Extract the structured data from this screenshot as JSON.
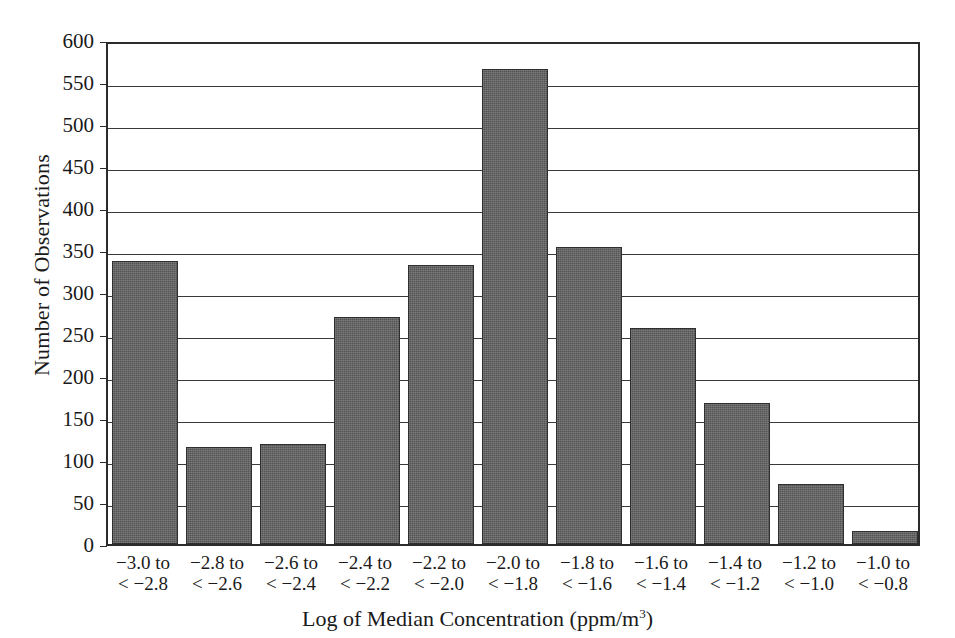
{
  "chart_data": {
    "type": "bar",
    "title": "",
    "xlabel": "Log of Median Concentration (ppm/m",
    "xlabel_sup": "3",
    "xlabel_tail": ")",
    "xlabel_full": "Log of Median Concentration (ppm/m3)",
    "ylabel": "Number of Observations",
    "ylim": [
      0,
      600
    ],
    "ytick_step": 50,
    "grid": true,
    "legend": "none",
    "bar_color": "#5d5d5d",
    "bar_edge_color": "#2f2f2f",
    "axis_color": "#2b2b2b",
    "yticks": [
      {
        "value": 600,
        "label": "600"
      },
      {
        "value": 550,
        "label": "550"
      },
      {
        "value": 500,
        "label": "500"
      },
      {
        "value": 450,
        "label": "450"
      },
      {
        "value": 400,
        "label": "400"
      },
      {
        "value": 350,
        "label": "350"
      },
      {
        "value": 300,
        "label": "300"
      },
      {
        "value": 250,
        "label": "250"
      },
      {
        "value": 200,
        "label": "200"
      },
      {
        "value": 150,
        "label": "150"
      },
      {
        "value": 100,
        "label": "100"
      },
      {
        "value": 50,
        "label": "50"
      },
      {
        "value": 0,
        "label": "0"
      }
    ],
    "categories": [
      "−3.0 to < −2.8",
      "−2.8 to < −2.6",
      "−2.6 to < −2.4",
      "−2.4 to < −2.2",
      "−2.2 to < −2.0",
      "−2.0 to < −1.8",
      "−1.8 to < −1.6",
      "−1.6 to < −1.4",
      "−1.4 to < −1.2",
      "−1.2 to < −1.0",
      "−1.0 to < −0.8"
    ],
    "category_lines": [
      {
        "line1": "−3.0 to",
        "line2": "< −2.8"
      },
      {
        "line1": "−2.8 to",
        "line2": "< −2.6"
      },
      {
        "line1": "−2.6 to",
        "line2": "< −2.4"
      },
      {
        "line1": "−2.4 to",
        "line2": "< −2.2"
      },
      {
        "line1": "−2.2 to",
        "line2": "< −2.0"
      },
      {
        "line1": "−2.0 to",
        "line2": "< −1.8"
      },
      {
        "line1": "−1.8 to",
        "line2": "< −1.6"
      },
      {
        "line1": "−1.6 to",
        "line2": "< −1.4"
      },
      {
        "line1": "−1.4 to",
        "line2": "< −1.2"
      },
      {
        "line1": "−1.2 to",
        "line2": "< −1.0"
      },
      {
        "line1": "−1.0 to",
        "line2": "< −0.8"
      }
    ],
    "values": [
      337,
      115,
      119,
      270,
      332,
      566,
      353,
      257,
      168,
      71,
      16
    ]
  }
}
